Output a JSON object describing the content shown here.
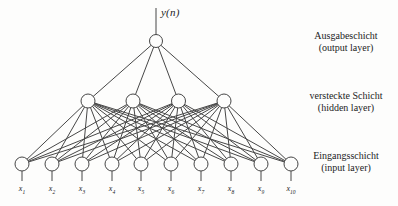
{
  "figure": {
    "output_signal": "y(n)",
    "network": {
      "type": "feedforward-neural-network",
      "fully_connected": true,
      "layers": [
        {
          "name": "output",
          "neurons": 1,
          "annotation_de": "Ausgabeschicht",
          "annotation_en": "(output layer)"
        },
        {
          "name": "hidden",
          "neurons": 4,
          "annotation_de": "versteckte Schicht",
          "annotation_en": "(hidden layer)"
        },
        {
          "name": "input",
          "neurons": 10,
          "annotation_de": "Eingangsschicht",
          "annotation_en": "(input layer)"
        }
      ],
      "input_labels": [
        {
          "base": "x",
          "sub": "1"
        },
        {
          "base": "x",
          "sub": "2"
        },
        {
          "base": "x",
          "sub": "3"
        },
        {
          "base": "x",
          "sub": "4"
        },
        {
          "base": "x",
          "sub": "5"
        },
        {
          "base": "x",
          "sub": "6"
        },
        {
          "base": "x",
          "sub": "7"
        },
        {
          "base": "x",
          "sub": "8"
        },
        {
          "base": "x",
          "sub": "9"
        },
        {
          "base": "x",
          "sub": "10"
        }
      ]
    }
  },
  "layout": {
    "canvas": {
      "width": 398,
      "height": 206
    },
    "output": {
      "y": 41,
      "xs": [
        156
      ],
      "r": 6.5
    },
    "hidden": {
      "y": 101,
      "xs": [
        88,
        133,
        178.5,
        224
      ],
      "r": 7
    },
    "input": {
      "y": 164,
      "xs": [
        22,
        52,
        82,
        112,
        141,
        171,
        201,
        231,
        261,
        291
      ],
      "r": 7
    },
    "output_stub_top": 8,
    "input_stub_bottom": 181,
    "input_label_baseline": 191,
    "colors": {
      "stroke": "#474747",
      "text": "#1c1c1c",
      "node_fill": "#fdfdfc",
      "background": "#fdfdfc"
    }
  }
}
